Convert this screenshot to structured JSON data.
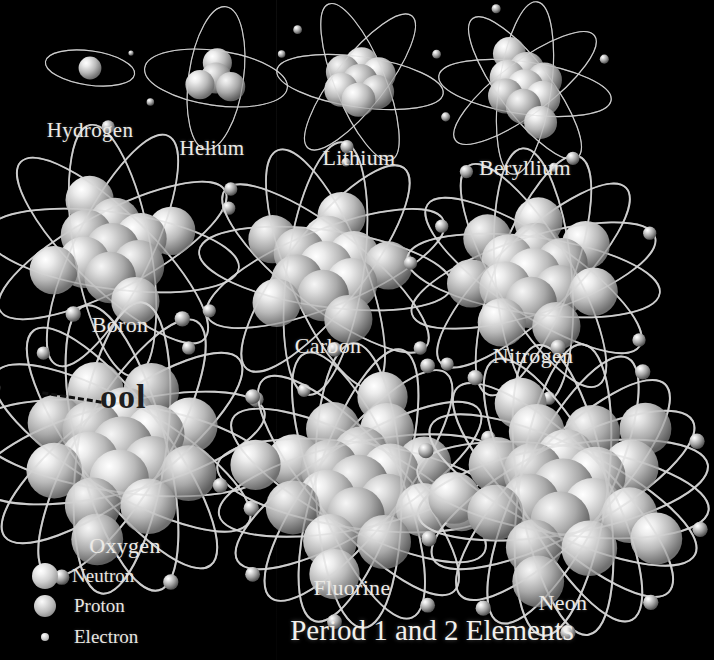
{
  "figure": {
    "title": "Period 1 and 2 Elements",
    "background_color": "#000000",
    "label_color": "#ecebe7",
    "artifact_text": "ool"
  },
  "legend": {
    "items": [
      {
        "label": "Neutron",
        "icon": "neutron-sphere",
        "size": 26,
        "color": "#d9d9d9"
      },
      {
        "label": "Proton",
        "icon": "proton-sphere",
        "size": 22,
        "color": "#c8c8c8"
      },
      {
        "label": "Electron",
        "icon": "electron-sphere",
        "size": 8,
        "color": "#e0e0e0"
      }
    ]
  },
  "elements": [
    {
      "name": "Hydrogen",
      "atomic_number": 1,
      "protons": 1,
      "neutrons": 0,
      "electrons": 1,
      "orbits": 1,
      "scale": 0.3,
      "cx": 90,
      "cy": 68,
      "label_x": 90,
      "label_y": 118
    },
    {
      "name": "Helium",
      "atomic_number": 2,
      "protons": 2,
      "neutrons": 2,
      "electrons": 2,
      "orbits": 2,
      "scale": 0.48,
      "cx": 216,
      "cy": 78,
      "label_x": 212,
      "label_y": 136
    },
    {
      "name": "Lithium",
      "atomic_number": 3,
      "protons": 3,
      "neutrons": 4,
      "electrons": 3,
      "orbits": 3,
      "scale": 0.56,
      "cx": 360,
      "cy": 82,
      "label_x": 359,
      "label_y": 145
    },
    {
      "name": "Beryllium",
      "atomic_number": 4,
      "protons": 4,
      "neutrons": 5,
      "electrons": 4,
      "orbits": 4,
      "scale": 0.58,
      "cx": 525,
      "cy": 88,
      "label_x": 525,
      "label_y": 155
    },
    {
      "name": "Boron",
      "atomic_number": 5,
      "protons": 5,
      "neutrons": 6,
      "electrons": 5,
      "orbits": 5,
      "scale": 0.85,
      "cx": 112,
      "cy": 250,
      "label_x": 120,
      "label_y": 312
    },
    {
      "name": "Carbon",
      "atomic_number": 6,
      "protons": 6,
      "neutrons": 6,
      "electrons": 6,
      "orbits": 6,
      "scale": 0.85,
      "cx": 325,
      "cy": 268,
      "label_x": 328,
      "label_y": 333
    },
    {
      "name": "Nitrogen",
      "atomic_number": 7,
      "protons": 7,
      "neutrons": 7,
      "electrons": 7,
      "orbits": 7,
      "scale": 0.85,
      "cx": 533,
      "cy": 275,
      "label_x": 533,
      "label_y": 343
    },
    {
      "name": "Oxygen",
      "atomic_number": 8,
      "protons": 8,
      "neutrons": 8,
      "electrons": 8,
      "orbits": 8,
      "scale": 0.98,
      "cx": 122,
      "cy": 448,
      "label_x": 125,
      "label_y": 533
    },
    {
      "name": "Fluorine",
      "atomic_number": 9,
      "protons": 9,
      "neutrons": 10,
      "electrons": 9,
      "orbits": 9,
      "scale": 0.95,
      "cx": 358,
      "cy": 485,
      "label_x": 352,
      "label_y": 575
    },
    {
      "name": "Neon",
      "atomic_number": 10,
      "protons": 10,
      "neutrons": 10,
      "electrons": 10,
      "orbits": 10,
      "scale": 0.98,
      "cx": 563,
      "cy": 490,
      "label_x": 563,
      "label_y": 590
    }
  ],
  "title_pos": {
    "x": 432,
    "y": 630
  }
}
